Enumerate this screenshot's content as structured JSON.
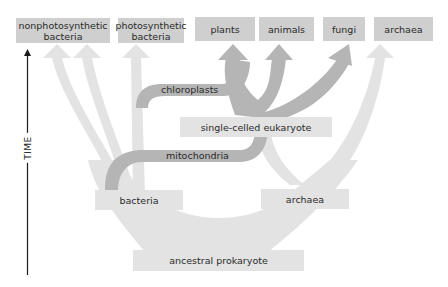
{
  "diagram": {
    "axis": {
      "label": "TIME",
      "direction": "up"
    },
    "top_groups": [
      {
        "label": "nonphotosynthetic bacteria",
        "line1": "nonphotosynthetic",
        "line2": "bacteria"
      },
      {
        "label": "photosynthetic bacteria",
        "line1": "photosynthetic",
        "line2": "bacteria"
      },
      {
        "label": "plants"
      },
      {
        "label": "animals"
      },
      {
        "label": "fungi"
      },
      {
        "label": "archaea"
      }
    ],
    "nodes": {
      "single_celled_eukaryote": "single-celled eukaryote",
      "bacteria": "bacteria",
      "archaea": "archaea",
      "ancestral_prokaryote": "ancestral prokaryote"
    },
    "branch_labels": {
      "chloroplasts": "chloroplasts",
      "mitochondria": "mitochondria"
    },
    "colors": {
      "light_branch": "#e3e3e3",
      "dark_branch": "#b5b5b5",
      "top_box": "#cfcfcf",
      "node_box": "#e3e3e3",
      "axis": "#1a1a1a"
    }
  }
}
